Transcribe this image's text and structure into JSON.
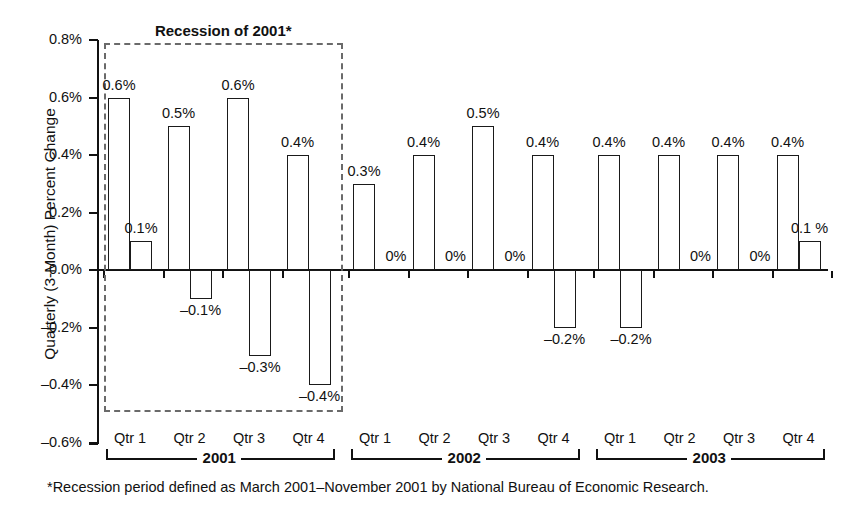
{
  "chart_data": {
    "type": "bar",
    "title": "",
    "xlabel": "",
    "ylabel": "Quarterly (3-Month) Percent Change",
    "ylim": [
      -0.6,
      0.8
    ],
    "ytick_labels": [
      "0.8%",
      "0.6%",
      "0.4%",
      "0.2%",
      "0.0%",
      "-0.2%",
      "-0.4%",
      "-0.6%"
    ],
    "ytick_values": [
      0.8,
      0.6,
      0.4,
      0.2,
      0.0,
      -0.2,
      -0.4,
      -0.6
    ],
    "grid": false,
    "legend": "none",
    "categories": [
      "2001 Qtr 1",
      "2001 Qtr 2",
      "2001 Qtr 3",
      "2001 Qtr 4",
      "2002 Qtr 1",
      "2002 Qtr 2",
      "2002 Qtr 3",
      "2002 Qtr 4",
      "2003 Qtr 1",
      "2003 Qtr 2",
      "2003 Qtr 3",
      "2003 Qtr 4"
    ],
    "series": [
      {
        "name": "first-bar",
        "values": [
          0.6,
          0.5,
          0.6,
          0.4,
          0.3,
          0.4,
          0.5,
          0.4,
          0.4,
          0.4,
          0.4,
          0.4
        ],
        "labels": [
          "0.6%",
          "0.5%",
          "0.6%",
          "0.4%",
          "0.3%",
          "0.4%",
          "0.5%",
          "0.4%",
          "0.4%",
          "0.4%",
          "0.4%",
          "0.4%"
        ]
      },
      {
        "name": "second-bar",
        "values": [
          0.1,
          -0.1,
          -0.3,
          -0.4,
          0.0,
          0.0,
          0.0,
          -0.2,
          -0.2,
          0.0,
          0.0,
          0.1
        ],
        "labels": [
          "0.1%",
          "-0.1%",
          "-0.3%",
          "-0.4%",
          "0%",
          "0%",
          "0%",
          "-0.2%",
          "-0.2%",
          "0%",
          "0%",
          "0.1 %"
        ]
      }
    ],
    "annotations": [
      {
        "name": "recession-of-2001",
        "text": "Recession of 2001*",
        "span_start": "2001 Qtr 1",
        "span_end": "2001 Qtr 4",
        "style": "dashed-box"
      }
    ],
    "footnote": "*Recession period defined as March 2001–November 2001 by National Bureau of Economic Research."
  },
  "axis": {
    "y_title": "Quarterly (3-Month) Percent Change",
    "ticks": [
      "0.8%",
      "0.6%",
      "0.4%",
      "0.2%",
      "0.0%",
      "–0.2%",
      "–0.4%",
      "–0.6%"
    ]
  },
  "quarters": [
    "Qtr 1",
    "Qtr 2",
    "Qtr 3",
    "Qtr 4",
    "Qtr 1",
    "Qtr 2",
    "Qtr 3",
    "Qtr 4",
    "Qtr 1",
    "Qtr 2",
    "Qtr 3",
    "Qtr 4"
  ],
  "bar_labels_top": [
    "0.6%",
    "0.5%",
    "0.6%",
    "0.4%",
    "0.3%",
    "0.4%",
    "0.5%",
    "0.4%",
    "0.4%",
    "0.4%",
    "0.4%",
    "0.4%"
  ],
  "bar_labels_second": [
    "0.1%",
    "–0.1%",
    "–0.3%",
    "–0.4%",
    "0%",
    "0%",
    "0%",
    "–0.2%",
    "–0.2%",
    "0%",
    "0%",
    "0.1 %"
  ],
  "years": [
    "2001",
    "2002",
    "2003"
  ],
  "recession": {
    "title": "Recession of 2001*"
  },
  "footnote": {
    "text": "*Recession period defined as March 2001–November 2001 by National Bureau of Economic Research."
  },
  "colors": {
    "axis": "#111111",
    "bar_stroke": "#1a1a1a",
    "bar_fill": "#ffffff",
    "recession_dash": "#6a6a6a",
    "background": "#ffffff"
  }
}
